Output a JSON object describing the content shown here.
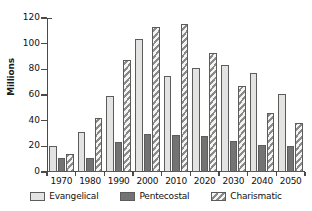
{
  "chart_data": {
    "type": "bar",
    "title": "",
    "xlabel": "",
    "ylabel": "Millions",
    "ylim": [
      0,
      120
    ],
    "yticks": [
      0,
      20,
      40,
      60,
      80,
      100,
      120
    ],
    "grid": false,
    "legend_position": "bottom",
    "categories": [
      "1970",
      "1980",
      "1990",
      "2000",
      "2010",
      "2020",
      "2030",
      "2040",
      "2050"
    ],
    "series": [
      {
        "name": "Evangelical",
        "color": "#e3e3e1",
        "values": [
          20,
          31,
          59,
          104,
          75,
          81,
          83,
          77,
          61
        ]
      },
      {
        "name": "Pentecostal",
        "color": "#737373",
        "values": [
          11,
          11,
          23,
          30,
          29,
          28,
          24,
          21,
          20
        ]
      },
      {
        "name": "Charismatic",
        "color": "#8a8a8a",
        "values": [
          14,
          42,
          87,
          113,
          115,
          93,
          67,
          46,
          38
        ]
      }
    ]
  },
  "axis": {
    "y_label": "Millions",
    "y_tick_labels": [
      "120",
      "100",
      "80",
      "60",
      "40",
      "20",
      "0"
    ]
  },
  "legend": {
    "items": [
      {
        "label": "Evangelical",
        "key": "evangelical"
      },
      {
        "label": "Pentecostal",
        "key": "pentecostal"
      },
      {
        "label": "Charismatic",
        "key": "charismatic"
      }
    ]
  }
}
